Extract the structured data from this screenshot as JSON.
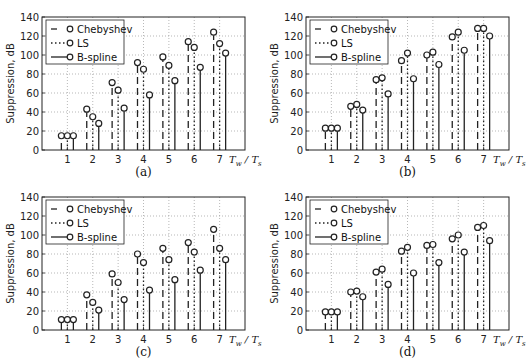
{
  "chart_data": [
    {
      "type": "stem",
      "panel_label": "(a)",
      "xlabel": "T_w / T_s",
      "ylabel": "Suppression, dB",
      "categories": [
        1,
        2,
        3,
        4,
        5,
        6,
        7
      ],
      "ylim": [
        0,
        140
      ],
      "yticks": [
        0,
        20,
        40,
        60,
        80,
        100,
        120,
        140
      ],
      "grid": true,
      "legend_position": "upper left",
      "series": [
        {
          "name": "Chebyshev",
          "style": "dashed",
          "values": [
            15,
            43,
            71,
            92,
            98,
            114,
            124
          ]
        },
        {
          "name": "LS",
          "style": "dotted",
          "values": [
            15,
            35,
            63,
            85,
            89,
            108,
            112
          ]
        },
        {
          "name": "B-spline",
          "style": "solid",
          "values": [
            15,
            28,
            44,
            58,
            73,
            87,
            102
          ]
        }
      ]
    },
    {
      "type": "stem",
      "panel_label": "(b)",
      "xlabel": "T_w / T_s",
      "ylabel": "Suppression, dB",
      "categories": [
        1,
        2,
        3,
        4,
        5,
        6,
        7
      ],
      "ylim": [
        0,
        140
      ],
      "yticks": [
        0,
        20,
        40,
        60,
        80,
        100,
        120,
        140
      ],
      "grid": true,
      "legend_position": "upper left",
      "series": [
        {
          "name": "Chebyshev",
          "style": "dashed",
          "values": [
            23,
            46,
            74,
            94,
            100,
            119,
            128
          ]
        },
        {
          "name": "LS",
          "style": "dotted",
          "values": [
            23,
            48,
            76,
            102,
            103,
            124,
            128
          ]
        },
        {
          "name": "B-spline",
          "style": "solid",
          "values": [
            23,
            42,
            59,
            75,
            90,
            105,
            120
          ]
        }
      ]
    },
    {
      "type": "stem",
      "panel_label": "(c)",
      "xlabel": "T_w / T_s",
      "ylabel": "Suppression, dB",
      "categories": [
        1,
        2,
        3,
        4,
        5,
        6,
        7
      ],
      "ylim": [
        0,
        140
      ],
      "yticks": [
        0,
        20,
        40,
        60,
        80,
        100,
        120,
        140
      ],
      "grid": true,
      "legend_position": "upper left",
      "series": [
        {
          "name": "Chebyshev",
          "style": "dashed",
          "values": [
            11,
            37,
            59,
            80,
            86,
            92,
            106
          ]
        },
        {
          "name": "LS",
          "style": "dotted",
          "values": [
            11,
            29,
            50,
            71,
            74,
            82,
            86
          ]
        },
        {
          "name": "B-spline",
          "style": "solid",
          "values": [
            11,
            21,
            32,
            42,
            53,
            63,
            74
          ]
        }
      ]
    },
    {
      "type": "stem",
      "panel_label": "(d)",
      "xlabel": "T_w / T_s",
      "ylabel": "Suppression, dB",
      "categories": [
        1,
        2,
        3,
        4,
        5,
        6,
        7
      ],
      "ylim": [
        0,
        140
      ],
      "yticks": [
        0,
        20,
        40,
        60,
        80,
        100,
        120,
        140
      ],
      "grid": true,
      "legend_position": "upper left",
      "series": [
        {
          "name": "Chebyshev",
          "style": "dashed",
          "values": [
            19,
            40,
            61,
            83,
            89,
            96,
            108
          ]
        },
        {
          "name": "LS",
          "style": "dotted",
          "values": [
            19,
            41,
            64,
            87,
            90,
            100,
            110
          ]
        },
        {
          "name": "B-spline",
          "style": "solid",
          "values": [
            19,
            35,
            48,
            60,
            71,
            82,
            94
          ]
        }
      ]
    }
  ],
  "labels": {
    "ylabel": "Suppression, dB",
    "xlabel_T": "T",
    "xlabel_w": "w",
    "xlabel_s": "s",
    "legend": [
      "Chebyshev",
      "LS",
      "B-spline"
    ]
  }
}
